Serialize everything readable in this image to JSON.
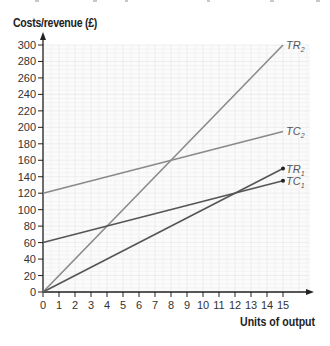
{
  "chart_data": {
    "type": "line",
    "title": "",
    "ylabel": "Costs/revenue (£)",
    "xlabel": "Units of output",
    "xlim": [
      0,
      15
    ],
    "ylim": [
      0,
      300
    ],
    "x_ticks": [
      0,
      1,
      2,
      3,
      4,
      5,
      6,
      7,
      8,
      9,
      10,
      11,
      12,
      13,
      14,
      15
    ],
    "y_ticks": [
      0,
      20,
      40,
      60,
      80,
      100,
      120,
      140,
      160,
      180,
      200,
      220,
      240,
      260,
      280,
      300
    ],
    "grid": true,
    "legend": "inline labels at line ends",
    "series": [
      {
        "name": "TR2",
        "label_main": "TR",
        "label_sub": "2",
        "x": [
          0,
          15
        ],
        "values": [
          0,
          300
        ],
        "color": "#8a8a8a",
        "end_marker": false
      },
      {
        "name": "TC2",
        "label_main": "TC",
        "label_sub": "2",
        "x": [
          0,
          15
        ],
        "values": [
          120,
          195
        ],
        "color": "#8a8a8a",
        "end_marker": false
      },
      {
        "name": "TR1",
        "label_main": "TR",
        "label_sub": "1",
        "x": [
          0,
          15
        ],
        "values": [
          0,
          150
        ],
        "color": "#555555",
        "end_marker": true
      },
      {
        "name": "TC1",
        "label_main": "TC",
        "label_sub": "1",
        "x": [
          0,
          15
        ],
        "values": [
          60,
          135
        ],
        "color": "#555555",
        "end_marker": true
      }
    ]
  },
  "axes": {
    "y_title": "Costs/revenue (£)",
    "x_title": "Units of output"
  }
}
